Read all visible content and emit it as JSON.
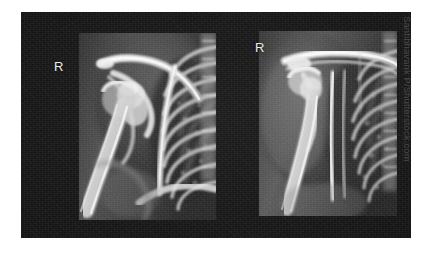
{
  "image": {
    "kind": "radiograph-pair",
    "description": "Two anteroposterior shoulder X-ray films mounted side by side on a black viewing board",
    "background_color": "#ffffff",
    "board_color": "#141414"
  },
  "board": {
    "panels": [
      {
        "id": "panel-left",
        "name": "left-radiograph",
        "view": "AP right shoulder",
        "marker": "R",
        "marker_color": "#e9e9e9"
      },
      {
        "id": "panel-right",
        "name": "right-radiograph",
        "view": "AP right shoulder - second projection",
        "marker": "R",
        "marker_color": "#e9e9e9"
      }
    ]
  },
  "credit": {
    "text": "Santibhavank P/Shutterstock.com",
    "color": "#4a4a4a",
    "orientation": "vertical"
  }
}
